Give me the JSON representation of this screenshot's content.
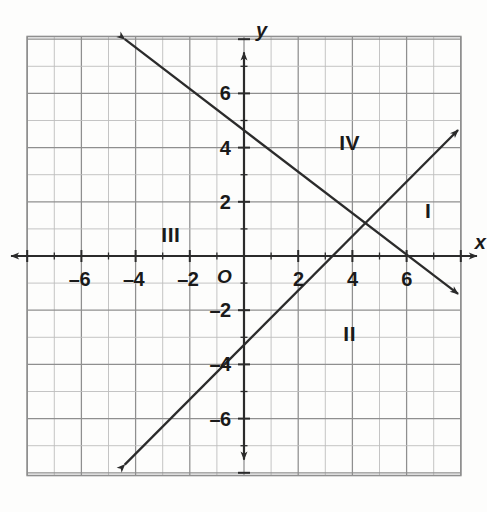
{
  "figure": {
    "kind": "coordinate-plane",
    "background_color": "#fdfdfc",
    "ink_color": "#2b2b2b",
    "grid_color": "#8f8f8f",
    "grid_minor_color": "#bdbdbd"
  },
  "axes": {
    "x_axis_label": "x",
    "y_axis_label": "y",
    "origin_label": "O",
    "x_ticks": [
      {
        "label": "–6",
        "value": -6
      },
      {
        "label": "–4",
        "value": -4
      },
      {
        "label": "–2",
        "value": -2
      },
      {
        "label": "2",
        "value": 2
      },
      {
        "label": "4",
        "value": 4
      },
      {
        "label": "6",
        "value": 6
      }
    ],
    "y_ticks": [
      {
        "label": "6",
        "value": 6
      },
      {
        "label": "4",
        "value": 4
      },
      {
        "label": "2",
        "value": 2
      },
      {
        "label": "–2",
        "value": -2
      },
      {
        "label": "–4",
        "value": -4
      },
      {
        "label": "–6",
        "value": -6
      }
    ]
  },
  "quadrant_labels": [
    {
      "label": "I",
      "x": 6.8,
      "y": 1.7
    },
    {
      "label": "II",
      "x": 3.9,
      "y": -2.85
    },
    {
      "label": "III",
      "x": -2.7,
      "y": 0.8
    },
    {
      "label": "IV",
      "x": 3.9,
      "y": 4.2
    }
  ],
  "chart_data": {
    "type": "line",
    "title": "",
    "xlabel": "x",
    "ylabel": "y",
    "xlim": [
      -8,
      8
    ],
    "ylim": [
      -8.1,
      8.1
    ],
    "grid": true,
    "grid_step": 1,
    "legend": "none",
    "series": [
      {
        "name": "descending-line",
        "equation": "y = -x + 4",
        "slope": -1,
        "y_intercept": 4,
        "x_intercept": 4,
        "arrows": "both",
        "endpoints": [
          {
            "x": -4.4,
            "y": 8.0
          },
          {
            "x": 7.9,
            "y": -1.4
          }
        ],
        "points": [
          {
            "x": -4,
            "y": 8
          },
          {
            "x": 0,
            "y": 4
          },
          {
            "x": 4,
            "y": 0
          },
          {
            "x": 7.9,
            "y": -3.9
          }
        ]
      },
      {
        "name": "ascending-line",
        "equation": "y = x - 3",
        "slope": 1,
        "y_intercept": -3,
        "x_intercept": 3,
        "arrows": "both",
        "endpoints": [
          {
            "x": -4.4,
            "y": -7.7
          },
          {
            "x": 7.9,
            "y": 4.65
          }
        ],
        "points": [
          {
            "x": -4.4,
            "y": -7.4
          },
          {
            "x": 0,
            "y": -3
          },
          {
            "x": 3,
            "y": 0
          },
          {
            "x": 7.9,
            "y": 4.9
          }
        ]
      }
    ],
    "intersection": {
      "x": 3.5,
      "y": 0.5
    }
  }
}
